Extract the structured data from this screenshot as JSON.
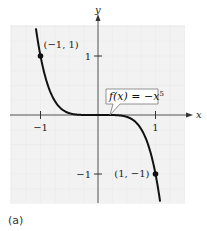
{
  "chart_data": {
    "type": "line",
    "title": "",
    "function_label": "f(x) = −x⁵",
    "function_label_parts": {
      "lhs": "f(x) = −x",
      "exp": "5"
    },
    "xlabel": "x",
    "ylabel": "y",
    "xlim": [
      -1.5,
      1.5
    ],
    "ylim": [
      -1.5,
      1.5
    ],
    "x_ticks": [
      {
        "value": -1,
        "label": "−1"
      },
      {
        "value": 1,
        "label": "1"
      }
    ],
    "y_ticks": [
      {
        "value": 1,
        "label": "1"
      },
      {
        "value": -1,
        "label": "−1"
      }
    ],
    "grid": true,
    "series": [
      {
        "name": "f(x) = -x^5",
        "expression": "-x^5",
        "color": "#111111"
      }
    ],
    "points": [
      {
        "x": -1,
        "y": 1,
        "label": "(−1, 1)"
      },
      {
        "x": 1,
        "y": -1,
        "label": "(1, −1)"
      }
    ],
    "grid_background": "#f2f2f2"
  },
  "caption": "(a)"
}
